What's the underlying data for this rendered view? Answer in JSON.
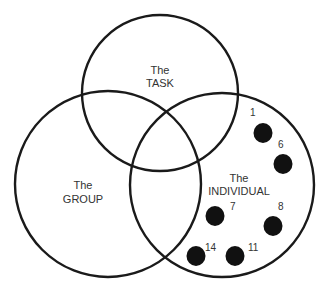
{
  "diagram": {
    "type": "venn",
    "circles": [
      {
        "id": "task",
        "label_line1": "The",
        "label_line2": "TASK"
      },
      {
        "id": "group",
        "label_line1": "The",
        "label_line2": "GROUP"
      },
      {
        "id": "individual",
        "label_line1": "The",
        "label_line2": "INDIVIDUAL"
      }
    ],
    "individual_members": [
      {
        "label": "1"
      },
      {
        "label": "6"
      },
      {
        "label": "7"
      },
      {
        "label": "8"
      },
      {
        "label": "14"
      },
      {
        "label": "11"
      }
    ],
    "colors": {
      "stroke": "#1a1a1a",
      "dot": "#111111",
      "text": "#333333"
    }
  }
}
